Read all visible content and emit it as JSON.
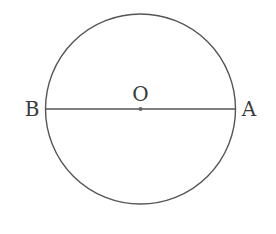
{
  "diagram": {
    "type": "circle-with-diameter",
    "circle": {
      "cx": 140.5,
      "cy": 109,
      "r": 95,
      "stroke": "#555555"
    },
    "diameter": {
      "from": "B",
      "to": "A",
      "stroke": "#555555"
    },
    "points": [
      {
        "id": "O",
        "label": "O",
        "x": 140.5,
        "y": 109,
        "role": "center"
      },
      {
        "id": "B",
        "label": "B",
        "x": 45.5,
        "y": 109,
        "role": "endpoint"
      },
      {
        "id": "A",
        "label": "A",
        "x": 235.5,
        "y": 109,
        "role": "endpoint"
      }
    ],
    "labels": {
      "center": "O",
      "left": "B",
      "right": "A"
    }
  }
}
